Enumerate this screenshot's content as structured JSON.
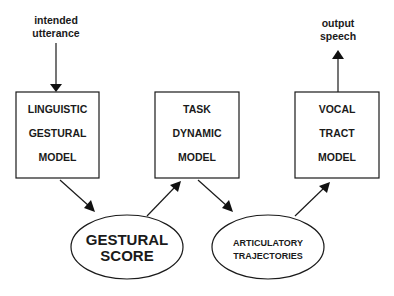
{
  "diagram": {
    "input_label": [
      "intended",
      "utterance"
    ],
    "output_label": [
      "output",
      "speech"
    ],
    "boxes": [
      {
        "id": "linguistic-gestural-model",
        "lines": [
          "LINGUISTIC",
          "GESTURAL",
          "MODEL"
        ]
      },
      {
        "id": "task-dynamic-model",
        "lines": [
          "TASK",
          "DYNAMIC",
          "MODEL"
        ]
      },
      {
        "id": "vocal-tract-model",
        "lines": [
          "VOCAL",
          "TRACT",
          "MODEL"
        ]
      }
    ],
    "ellipses": [
      {
        "id": "gestural-score",
        "lines": [
          "GESTURAL",
          "SCORE"
        ]
      },
      {
        "id": "articulatory-trajectories",
        "lines": [
          "ARTICULATORY",
          "TRAJECTORIES"
        ]
      }
    ],
    "flow": [
      "intended utterance -> LINGUISTIC GESTURAL MODEL",
      "LINGUISTIC GESTURAL MODEL -> GESTURAL SCORE",
      "GESTURAL SCORE -> TASK DYNAMIC MODEL",
      "TASK DYNAMIC MODEL -> ARTICULATORY TRAJECTORIES",
      "ARTICULATORY TRAJECTORIES -> VOCAL TRACT MODEL",
      "VOCAL TRACT MODEL -> output speech"
    ]
  }
}
